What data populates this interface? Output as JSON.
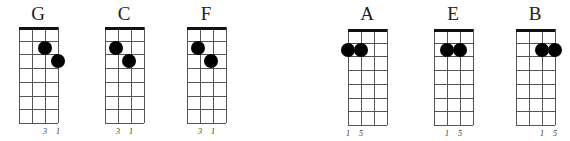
{
  "diagram": {
    "type": "ukulele-chord-chart",
    "groups": [
      {
        "chords": [
          {
            "name": "G",
            "left": 19,
            "top": 27,
            "dots": [
              {
                "string": 2,
                "row": 1
              },
              {
                "string": 3,
                "row": 2
              }
            ],
            "fingers": [
              {
                "string": 2,
                "label": "3"
              },
              {
                "string": 3,
                "label": "1"
              }
            ]
          },
          {
            "name": "C",
            "left": 105,
            "top": 27,
            "dots": [
              {
                "string": 0.85,
                "row": 1
              },
              {
                "string": 1.85,
                "row": 2
              }
            ],
            "fingers": [
              {
                "string": 1,
                "label": "3"
              },
              {
                "string": 2,
                "label": "1"
              }
            ]
          },
          {
            "name": "F",
            "left": 187,
            "top": 27,
            "dots": [
              {
                "string": 0.85,
                "row": 1
              },
              {
                "string": 1.85,
                "row": 2
              }
            ],
            "fingers": [
              {
                "string": 1,
                "label": "3"
              },
              {
                "string": 2,
                "label": "1"
              }
            ]
          }
        ]
      },
      {
        "chords": [
          {
            "name": "A",
            "left": 348,
            "top": 29,
            "dots": [
              {
                "string": 0,
                "row": 1
              },
              {
                "string": 1,
                "row": 1
              }
            ],
            "fingers": [
              {
                "string": 0,
                "label": "1"
              },
              {
                "string": 1,
                "label": "5"
              }
            ]
          },
          {
            "name": "E",
            "left": 434,
            "top": 29,
            "dots": [
              {
                "string": 1,
                "row": 1
              },
              {
                "string": 2,
                "row": 1
              }
            ],
            "fingers": [
              {
                "string": 1,
                "label": "1"
              },
              {
                "string": 2,
                "label": "5"
              }
            ]
          },
          {
            "name": "B",
            "left": 516,
            "top": 29,
            "dots": [
              {
                "string": 2,
                "row": 1
              },
              {
                "string": 3,
                "row": 1
              }
            ],
            "fingers": [
              {
                "string": 2,
                "label": "1"
              },
              {
                "string": 3,
                "label": "5"
              }
            ]
          }
        ]
      }
    ],
    "strings": 4,
    "frets": 7,
    "string_spacing": 13,
    "fret_spacing": 13.7,
    "colors": {
      "dot": "#000000",
      "nut": "#111111",
      "line": "#555555",
      "text": "#222222"
    }
  }
}
